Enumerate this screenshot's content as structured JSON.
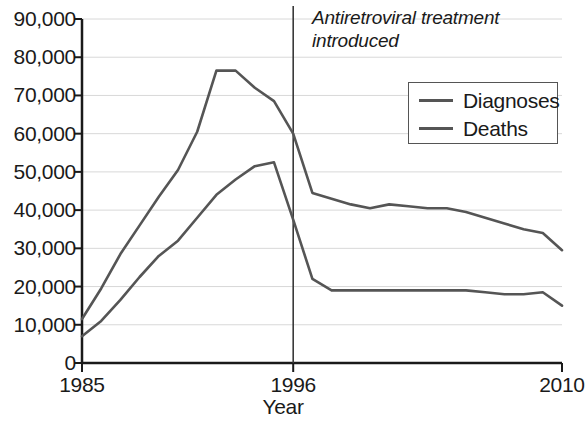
{
  "chart_data": {
    "type": "line",
    "title": "",
    "subtitle": "",
    "xlabel": "Year",
    "ylabel": "",
    "grid": true,
    "legend_position": "top-right",
    "xlim": [
      1985,
      2010
    ],
    "ylim": [
      0,
      90000
    ],
    "x_tick_labels": [
      "1985",
      "1996",
      "2010"
    ],
    "x_tick_values": [
      1985,
      1996,
      2010
    ],
    "y_tick_labels": [
      "0",
      "10,000",
      "20,000",
      "30,000",
      "40,000",
      "50,000",
      "60,000",
      "70,000",
      "80,000",
      "90,000"
    ],
    "y_tick_values": [
      0,
      10000,
      20000,
      30000,
      40000,
      50000,
      60000,
      70000,
      80000,
      90000
    ],
    "x": [
      1985,
      1986,
      1987,
      1988,
      1989,
      1990,
      1991,
      1992,
      1993,
      1994,
      1995,
      1996,
      1997,
      1998,
      1999,
      2000,
      2001,
      2002,
      2003,
      2004,
      2005,
      2006,
      2007,
      2008,
      2009,
      2010
    ],
    "series": [
      {
        "name": "Diagnoses",
        "color": "#555555",
        "values": [
          11500,
          19500,
          28500,
          36000,
          43500,
          50500,
          60500,
          76500,
          76500,
          72000,
          68500,
          60000,
          44500,
          43000,
          41500,
          40500,
          41500,
          41000,
          40500,
          40500,
          39500,
          38000,
          36500,
          35000,
          34000,
          29500
        ]
      },
      {
        "name": "Deaths",
        "color": "#555555",
        "values": [
          7000,
          11000,
          16500,
          22500,
          28000,
          32000,
          38000,
          44000,
          48000,
          51500,
          52500,
          37500,
          22000,
          19000,
          19000,
          19000,
          19000,
          19000,
          19000,
          19000,
          19000,
          18500,
          18000,
          18000,
          18500,
          15000
        ]
      }
    ],
    "annotations": [
      {
        "name": "antiretroviral-marker",
        "text_line1": "Antiretroviral treatment",
        "text_line2": "introduced",
        "x": 1996,
        "style": "vertical-line-with-italic-label"
      }
    ],
    "axis_color": "#1a1a1a",
    "grid_color": "#d8d8d8"
  },
  "legend": {
    "items": [
      {
        "label": "Diagnoses"
      },
      {
        "label": "Deaths"
      }
    ]
  }
}
